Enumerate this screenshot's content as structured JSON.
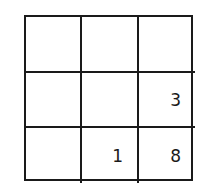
{
  "grid": {
    "rows": 3,
    "cols": 3,
    "cells": [
      [
        "",
        "",
        ""
      ],
      [
        "",
        "",
        "3"
      ],
      [
        "",
        "1",
        "8"
      ]
    ]
  }
}
